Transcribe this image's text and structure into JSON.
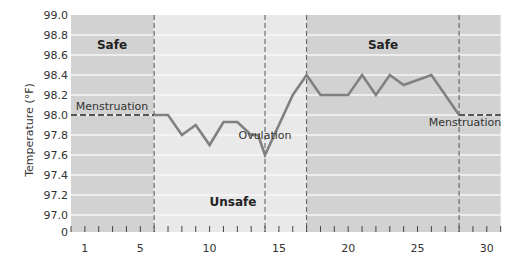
{
  "chart_data": {
    "type": "line",
    "title": "",
    "xlabel": "",
    "ylabel": "Temperature (°F)",
    "xlim": [
      0,
      31
    ],
    "ylim": [
      96.8,
      99.0
    ],
    "x_ticks": [
      1,
      5,
      10,
      15,
      20,
      25,
      30
    ],
    "y_ticks": [
      "0",
      "97.0",
      "97.2",
      "97.4",
      "97.6",
      "97.8",
      "98.0",
      "98.2",
      "98.4",
      "98.6",
      "98.8",
      "99.0"
    ],
    "y_axis_break": true,
    "grid": {
      "horizontal": true,
      "vertical": false
    },
    "series": [
      {
        "name": "Menstruation (start, dashed)",
        "style": "dashed",
        "points": [
          [
            0,
            98.0
          ],
          [
            6,
            98.0
          ]
        ]
      },
      {
        "name": "Basal body temperature",
        "style": "solid",
        "points": [
          [
            6,
            98.0
          ],
          [
            7,
            98.0
          ],
          [
            8,
            97.8
          ],
          [
            9,
            97.9
          ],
          [
            10,
            97.7
          ],
          [
            11,
            97.93
          ],
          [
            12,
            97.93
          ],
          [
            13,
            97.8
          ],
          [
            13.5,
            97.8
          ],
          [
            14,
            97.6
          ],
          [
            16,
            98.2
          ],
          [
            17,
            98.4
          ],
          [
            18,
            98.2
          ],
          [
            19,
            98.2
          ],
          [
            20,
            98.2
          ],
          [
            21,
            98.4
          ],
          [
            22,
            98.2
          ],
          [
            23,
            98.4
          ],
          [
            24,
            98.3
          ],
          [
            26,
            98.4
          ],
          [
            28,
            98.0
          ]
        ]
      },
      {
        "name": "Menstruation (end, dashed)",
        "style": "dashed",
        "points": [
          [
            28,
            98.0
          ],
          [
            31,
            98.0
          ]
        ]
      }
    ],
    "regions": [
      {
        "label": "Safe",
        "x_start": 0,
        "x_end": 6,
        "shade": "dark"
      },
      {
        "label": "Unsafe",
        "x_start": 6,
        "x_end": 17,
        "shade": "light"
      },
      {
        "label": "Safe",
        "x_start": 17,
        "x_end": 31,
        "shade": "dark"
      }
    ],
    "vertical_dashed_lines": [
      6,
      14,
      17,
      28
    ],
    "annotations": [
      {
        "text": "Menstruation",
        "x": 2.5,
        "y": 98.05
      },
      {
        "text": "Ovulation",
        "x": 14,
        "y": 97.55
      },
      {
        "text": "Menstruation",
        "x": 29,
        "y": 97.95
      }
    ]
  },
  "labels": {
    "ylabel": "Temperature (°F)",
    "safe_left": "Safe",
    "safe_right": "Safe",
    "unsafe": "Unsafe",
    "menstruation_left": "Menstruation",
    "menstruation_right": "Menstruation",
    "ovulation": "Ovulation"
  },
  "colors": {
    "dark_region": "#d2d2d2",
    "light_region": "#e9e9e9",
    "gridline": "#f6f6f6",
    "line": "#808080",
    "dashed": "#555555",
    "text": "#333333"
  }
}
